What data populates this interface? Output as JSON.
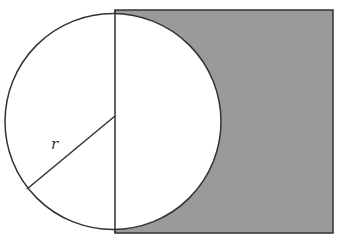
{
  "diagram": {
    "radius_label": "r",
    "colors": {
      "background": "#ffffff",
      "shaded_region": "#9a9a9a",
      "stroke": "#333333",
      "circle_fill": "#ffffff"
    },
    "geometry": {
      "circle_center": [
        115,
        121
      ],
      "circle_radius": 108,
      "rectangle": {
        "x": 115,
        "y": 10,
        "width": 218,
        "height": 223
      },
      "diameter": {
        "x": 115,
        "y1": 10,
        "y2": 233
      },
      "radius_segment": {
        "from": [
          115,
          117
        ],
        "to": [
          27,
          189
        ]
      },
      "label_position": [
        53,
        147
      ]
    }
  }
}
